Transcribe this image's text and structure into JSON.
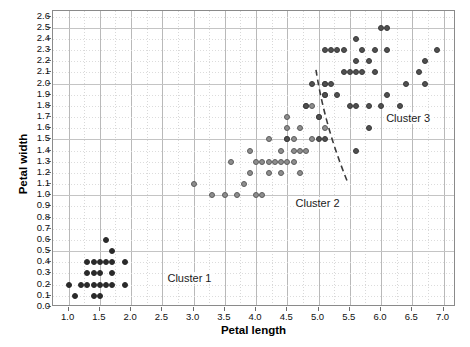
{
  "chart_data": {
    "type": "scatter",
    "title": "",
    "xlabel": "Petal length",
    "ylabel": "Petal width",
    "xlim": [
      0.75,
      7.2
    ],
    "ylim": [
      0.0,
      2.65
    ],
    "grid": true,
    "legend_position": "none",
    "x_ticks": [
      "1.0",
      "1.5",
      "2.0",
      "2.5",
      "3.0",
      "3.5",
      "4.0",
      "4.5",
      "5.0",
      "5.5",
      "6.0",
      "6.5",
      "7.0"
    ],
    "x_tick_values": [
      1.0,
      1.5,
      2.0,
      2.5,
      3.0,
      3.5,
      4.0,
      4.5,
      5.0,
      5.5,
      6.0,
      6.5,
      7.0
    ],
    "y_ticks": [
      "0.0",
      "0.1",
      "0.2",
      "0.3",
      "0.4",
      "0.5",
      "0.6",
      "0.7",
      "0.8",
      "0.9",
      "1.0",
      "1.1",
      "1.2",
      "1.3",
      "1.4",
      "1.5",
      "1.6",
      "1.7",
      "1.8",
      "1.9",
      "2.0",
      "2.1",
      "2.2",
      "2.3",
      "2.4",
      "2.5",
      "2.6"
    ],
    "y_tick_values": [
      0.0,
      0.1,
      0.2,
      0.3,
      0.4,
      0.5,
      0.6,
      0.7,
      0.8,
      0.9,
      1.0,
      1.1,
      1.2,
      1.3,
      1.4,
      1.5,
      1.6,
      1.7,
      1.8,
      1.9,
      2.0,
      2.1,
      2.2,
      2.3,
      2.4,
      2.5,
      2.6
    ],
    "series": [
      {
        "name": "Cluster 1",
        "color": "#2a2a2a",
        "marker": "filled-circle",
        "points": [
          [
            1.0,
            0.2
          ],
          [
            1.1,
            0.1
          ],
          [
            1.2,
            0.2
          ],
          [
            1.3,
            0.2
          ],
          [
            1.3,
            0.3
          ],
          [
            1.3,
            0.4
          ],
          [
            1.4,
            0.1
          ],
          [
            1.4,
            0.2
          ],
          [
            1.4,
            0.3
          ],
          [
            1.4,
            0.4
          ],
          [
            1.5,
            0.1
          ],
          [
            1.5,
            0.2
          ],
          [
            1.5,
            0.3
          ],
          [
            1.5,
            0.4
          ],
          [
            1.6,
            0.2
          ],
          [
            1.6,
            0.4
          ],
          [
            1.6,
            0.6
          ],
          [
            1.7,
            0.2
          ],
          [
            1.7,
            0.3
          ],
          [
            1.7,
            0.4
          ],
          [
            1.7,
            0.5
          ],
          [
            1.9,
            0.2
          ],
          [
            1.9,
            0.4
          ]
        ]
      },
      {
        "name": "Cluster 2",
        "color": "#8e8e8e",
        "marker": "open-circle",
        "points": [
          [
            3.0,
            1.1
          ],
          [
            3.3,
            1.0
          ],
          [
            3.5,
            1.0
          ],
          [
            3.6,
            1.3
          ],
          [
            3.7,
            1.0
          ],
          [
            3.8,
            1.1
          ],
          [
            3.9,
            1.2
          ],
          [
            3.9,
            1.4
          ],
          [
            4.0,
            1.0
          ],
          [
            4.0,
            1.3
          ],
          [
            4.1,
            1.0
          ],
          [
            4.1,
            1.3
          ],
          [
            4.2,
            1.2
          ],
          [
            4.2,
            1.3
          ],
          [
            4.2,
            1.5
          ],
          [
            4.3,
            1.3
          ],
          [
            4.4,
            1.2
          ],
          [
            4.4,
            1.3
          ],
          [
            4.4,
            1.4
          ],
          [
            4.5,
            1.3
          ],
          [
            4.5,
            1.5
          ],
          [
            4.5,
            1.6
          ],
          [
            4.5,
            1.7
          ],
          [
            4.6,
            1.3
          ],
          [
            4.6,
            1.4
          ],
          [
            4.6,
            1.5
          ],
          [
            4.7,
            1.2
          ],
          [
            4.7,
            1.4
          ],
          [
            4.7,
            1.6
          ],
          [
            4.8,
            1.4
          ],
          [
            4.8,
            1.8
          ],
          [
            4.9,
            1.5
          ],
          [
            4.9,
            1.8
          ],
          [
            5.0,
            1.7
          ],
          [
            5.1,
            1.6
          ],
          [
            5.1,
            1.9
          ],
          [
            5.1,
            2.0
          ]
        ]
      },
      {
        "name": "Cluster 3",
        "color": "#505050",
        "marker": "filled-circle",
        "points": [
          [
            4.5,
            1.5
          ],
          [
            4.8,
            1.8
          ],
          [
            4.9,
            2.0
          ],
          [
            5.0,
            1.5
          ],
          [
            5.0,
            1.7
          ],
          [
            5.1,
            1.5
          ],
          [
            5.1,
            1.9
          ],
          [
            5.1,
            2.0
          ],
          [
            5.1,
            2.3
          ],
          [
            5.2,
            2.0
          ],
          [
            5.2,
            2.3
          ],
          [
            5.3,
            1.9
          ],
          [
            5.3,
            2.3
          ],
          [
            5.4,
            2.1
          ],
          [
            5.4,
            2.3
          ],
          [
            5.5,
            1.8
          ],
          [
            5.5,
            2.1
          ],
          [
            5.6,
            1.4
          ],
          [
            5.6,
            1.8
          ],
          [
            5.6,
            2.1
          ],
          [
            5.6,
            2.2
          ],
          [
            5.6,
            2.4
          ],
          [
            5.7,
            2.1
          ],
          [
            5.7,
            2.3
          ],
          [
            5.8,
            1.6
          ],
          [
            5.8,
            1.8
          ],
          [
            5.8,
            2.2
          ],
          [
            5.9,
            2.1
          ],
          [
            5.9,
            2.3
          ],
          [
            6.0,
            1.8
          ],
          [
            6.0,
            2.5
          ],
          [
            6.1,
            1.9
          ],
          [
            6.1,
            2.3
          ],
          [
            6.1,
            2.5
          ],
          [
            6.3,
            1.8
          ],
          [
            6.4,
            2.0
          ],
          [
            6.6,
            2.1
          ],
          [
            6.7,
            2.0
          ],
          [
            6.7,
            2.2
          ],
          [
            6.9,
            2.3
          ]
        ]
      }
    ],
    "annotations": [
      {
        "name": "cluster-1-label",
        "text": "Cluster 1",
        "x": 2.55,
        "y": 0.25
      },
      {
        "name": "cluster-2-label",
        "text": "Cluster 2",
        "x": 4.6,
        "y": 0.92
      },
      {
        "name": "cluster-3-label",
        "text": "Cluster 3",
        "x": 6.05,
        "y": 1.68
      },
      {
        "name": "cluster-divider",
        "type": "dashed-line",
        "x1": 4.98,
        "y1": 2.12,
        "x2": 5.48,
        "y2": 1.12
      }
    ]
  },
  "colors": {
    "cluster1": "#2a2a2a",
    "cluster2": "#8e8e8e",
    "cluster3": "#505050",
    "frame": "#8a8a8a",
    "grid_major": "#b9b9b9",
    "grid_minor": "#dcdcdc",
    "divider": "#3c3c3c",
    "background": "#ffffff"
  }
}
